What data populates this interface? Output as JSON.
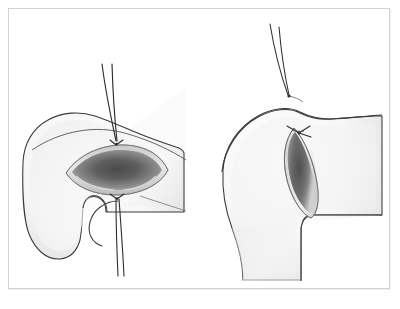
{
  "document": {
    "title": "Surgical wound closure illustration",
    "caption": "",
    "background_color": "#ffffff",
    "frame_color": "#d2d2d2"
  },
  "palette": {
    "outline": "#3a3a3a",
    "skin_light": "#fdfdfd",
    "skin_shadow": "#e2e2e2",
    "skin_mid": "#ededed",
    "wound_dark": "#545454",
    "wound_mid": "#8c8c8c",
    "wound_rim": "#d8d8d8",
    "suture": "#2e2e2e"
  },
  "figures": [
    {
      "id": "left-panel",
      "label": "Open wound with vertical suture strands",
      "view": "frontal",
      "elements": [
        {
          "name": "skin-surface",
          "type": "body-contour"
        },
        {
          "name": "wound-opening",
          "type": "lens-shaped-incision"
        },
        {
          "name": "suture-thread-upper",
          "type": "thread-pair"
        },
        {
          "name": "suture-thread-lower",
          "type": "thread-pair"
        },
        {
          "name": "suture-knot-upper",
          "type": "knot"
        },
        {
          "name": "suture-knot-lower",
          "type": "knot"
        },
        {
          "name": "curved-needle",
          "type": "needle-arc"
        },
        {
          "name": "background-panel-edge",
          "type": "diagonal-edge"
        }
      ]
    },
    {
      "id": "right-panel",
      "label": "Lateral view with closed wound and tied knot",
      "view": "lateral",
      "elements": [
        {
          "name": "skin-surface",
          "type": "body-contour"
        },
        {
          "name": "wound-opening",
          "type": "elongated-incision"
        },
        {
          "name": "suture-thread-pair",
          "type": "thread-pair"
        },
        {
          "name": "suture-entry-point",
          "type": "puncture"
        },
        {
          "name": "suture-knot-tied",
          "type": "knot-with-tails"
        },
        {
          "name": "limb-contour",
          "type": "body-contour"
        }
      ]
    }
  ]
}
